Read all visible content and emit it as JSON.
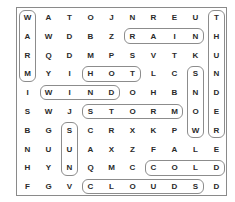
{
  "puzzle": {
    "grid": [
      [
        "W",
        "A",
        "T",
        "O",
        "J",
        "N",
        "R",
        "E",
        "U",
        "T"
      ],
      [
        "A",
        "W",
        "D",
        "B",
        "Z",
        "R",
        "A",
        "I",
        "N",
        "H"
      ],
      [
        "R",
        "Q",
        "D",
        "M",
        "P",
        "S",
        "V",
        "T",
        "K",
        "U"
      ],
      [
        "M",
        "Y",
        "I",
        "H",
        "O",
        "T",
        "L",
        "C",
        "S",
        "N"
      ],
      [
        "I",
        "W",
        "I",
        "N",
        "D",
        "O",
        "H",
        "B",
        "N",
        "D"
      ],
      [
        "S",
        "W",
        "J",
        "S",
        "T",
        "O",
        "R",
        "M",
        "O",
        "E"
      ],
      [
        "B",
        "G",
        "S",
        "C",
        "R",
        "X",
        "K",
        "P",
        "W",
        "R"
      ],
      [
        "N",
        "U",
        "U",
        "A",
        "X",
        "Z",
        "F",
        "A",
        "L",
        "E"
      ],
      [
        "H",
        "Y",
        "N",
        "Q",
        "M",
        "C",
        "C",
        "O",
        "L",
        "D"
      ],
      [
        "F",
        "G",
        "V",
        "C",
        "L",
        "O",
        "U",
        "D",
        "S",
        "D"
      ]
    ],
    "found_words": [
      {
        "word": "WARM",
        "start": [
          0,
          0
        ],
        "end": [
          3,
          0
        ]
      },
      {
        "word": "RAIN",
        "start": [
          1,
          5
        ],
        "end": [
          1,
          8
        ]
      },
      {
        "word": "THUNDER",
        "start": [
          0,
          9
        ],
        "end": [
          6,
          9
        ]
      },
      {
        "word": "HOT",
        "start": [
          3,
          3
        ],
        "end": [
          3,
          5
        ]
      },
      {
        "word": "SNOW",
        "start": [
          3,
          8
        ],
        "end": [
          6,
          8
        ]
      },
      {
        "word": "WIND",
        "start": [
          4,
          1
        ],
        "end": [
          4,
          4
        ]
      },
      {
        "word": "STORM",
        "start": [
          5,
          3
        ],
        "end": [
          5,
          7
        ]
      },
      {
        "word": "SUN",
        "start": [
          6,
          2
        ],
        "end": [
          8,
          2
        ]
      },
      {
        "word": "COLD",
        "start": [
          8,
          6
        ],
        "end": [
          8,
          9
        ]
      },
      {
        "word": "CLOUDS",
        "start": [
          9,
          3
        ],
        "end": [
          9,
          8
        ]
      }
    ]
  }
}
